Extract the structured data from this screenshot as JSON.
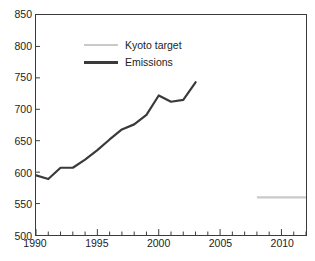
{
  "figure": {
    "clipped_title_fragment": "",
    "background_color": "#ffffff",
    "axis_color": "#3b3b3b"
  },
  "legend": {
    "position": "top-left-inside",
    "items": [
      {
        "label": "Kyoto target",
        "color": "#c9c9c9",
        "style": "thin-line"
      },
      {
        "label": "Emissions",
        "color": "#3a3a3a",
        "style": "thick-line"
      }
    ]
  },
  "axes": {
    "y_ticks": [
      "850",
      "800",
      "750",
      "700",
      "650",
      "600",
      "550",
      "500"
    ],
    "x_ticks": [
      "1990",
      "1995",
      "2000",
      "2005",
      "2010"
    ]
  },
  "chart_data": {
    "type": "line",
    "title": "",
    "subtitle": "",
    "xlabel": "",
    "ylabel": "",
    "xlim": [
      1990,
      2012
    ],
    "ylim": [
      500,
      850
    ],
    "ytick_values": [
      500,
      550,
      600,
      650,
      700,
      750,
      800,
      850
    ],
    "xtick_values": [
      1990,
      1995,
      2000,
      2005,
      2010
    ],
    "xminor_tick_step": 1,
    "grid": false,
    "legend_position": "upper left",
    "series": [
      {
        "name": "Emissions",
        "color": "#3a3a3a",
        "linewidth": 2.2,
        "x": [
          1990,
          1991,
          1992,
          1993,
          1994,
          1995,
          1996,
          1997,
          1998,
          1999,
          2000,
          2001,
          2002,
          2003
        ],
        "values": [
          595,
          589,
          607,
          607,
          620,
          635,
          652,
          668,
          676,
          691,
          722,
          712,
          715,
          743
        ]
      },
      {
        "name": "Kyoto target",
        "color": "#c9c9c9",
        "linewidth": 2.2,
        "x": [
          2008,
          2012
        ],
        "values": [
          560,
          560
        ]
      }
    ]
  }
}
